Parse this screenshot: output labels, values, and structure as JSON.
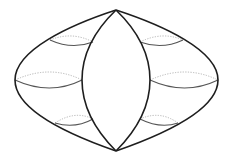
{
  "diagram": {
    "title": "",
    "colors": {
      "background": "#ffffff",
      "outline": "#1e1e1e",
      "front_arc": "#555555",
      "back_arc": "#b4b4b4"
    },
    "apex_top": [
      116,
      10
    ],
    "apex_bottom": [
      116,
      151
    ],
    "outer_left_path": "M116,10 C70,25 15,50 15,80 C15,110 70,135 116,151",
    "outer_right_path": "M116,10 C162,25 218,50 218,80 C218,110 162,135 116,151",
    "inner_left_path": "M116,10 C90,35 82,60 82,80 C82,100 90,125 116,151",
    "inner_right_path": "M116,10 C142,35 150,60 150,80 C150,100 142,125 116,151",
    "cross_sections": [
      {
        "name": "upper-left",
        "front": "M50,40 Q72,50 93,42",
        "back": "M50,40 Q72,31 93,42"
      },
      {
        "name": "middle-left",
        "front": "M15,80 Q50,96 82,80",
        "back": "M15,80 Q50,64 82,80"
      },
      {
        "name": "lower-left",
        "front": "M55,123 Q75,129 93,119",
        "back": "M55,123 Q75,110 93,119"
      },
      {
        "name": "upper-right",
        "front": "M140,42 Q162,50 183,40",
        "back": "M140,42 Q162,31 183,40"
      },
      {
        "name": "middle-right",
        "front": "M150,80 Q185,96 218,80",
        "back": "M150,80 Q185,64 218,80"
      },
      {
        "name": "lower-right",
        "front": "M140,119 Q160,129 178,123",
        "back": "M140,119 Q160,110 178,123"
      }
    ]
  }
}
